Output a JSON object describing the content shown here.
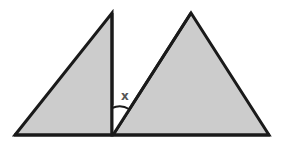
{
  "diagram": {
    "type": "geometry",
    "colors": {
      "fill": "#cccccc",
      "stroke": "#1a1a1a",
      "background": "#ffffff",
      "label": "#555555"
    },
    "shapes": [
      {
        "name": "left-right-triangle",
        "points": [
          [
            15,
            135
          ],
          [
            112,
            13
          ],
          [
            112,
            135
          ]
        ]
      },
      {
        "name": "right-triangle",
        "points": [
          [
            113,
            135
          ],
          [
            191,
            13
          ],
          [
            269,
            135
          ]
        ]
      }
    ],
    "angle_label": {
      "text": "x",
      "x": 125,
      "y": 99
    }
  }
}
